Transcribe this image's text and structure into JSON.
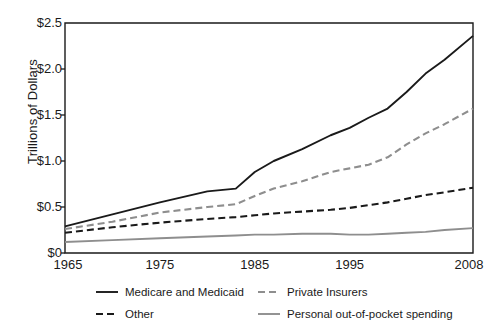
{
  "chart_data": {
    "type": "line",
    "title": "",
    "xlabel": "",
    "ylabel": "Trillions of Dollars",
    "xlim": [
      1965,
      2008
    ],
    "ylim": [
      0,
      2.5
    ],
    "grid": false,
    "legend_position": "bottom",
    "xticks": [
      "1965",
      "1975",
      "1985",
      "1995",
      "2008"
    ],
    "xtick_values": [
      1965,
      1975,
      1985,
      1995,
      2008
    ],
    "yticks": [
      "$0",
      "$0.5",
      "$1.0",
      "$1.5",
      "$2.0",
      "$2.5"
    ],
    "ytick_values": [
      0,
      0.5,
      1.0,
      1.5,
      2.0,
      2.5
    ],
    "x": [
      1965,
      1970,
      1975,
      1980,
      1983,
      1985,
      1987,
      1990,
      1993,
      1995,
      1997,
      1999,
      2001,
      2003,
      2005,
      2008
    ],
    "series": [
      {
        "name": "Medicare and Medicaid",
        "style": "solid",
        "color": "#1a1a1a",
        "values": [
          0.29,
          0.42,
          0.55,
          0.67,
          0.7,
          0.88,
          1.0,
          1.13,
          1.28,
          1.36,
          1.47,
          1.57,
          1.75,
          1.95,
          2.1,
          2.36
        ]
      },
      {
        "name": "Private Insurers",
        "style": "dashed",
        "color": "#8e8e8e",
        "values": [
          0.26,
          0.34,
          0.44,
          0.5,
          0.53,
          0.62,
          0.7,
          0.78,
          0.88,
          0.92,
          0.96,
          1.04,
          1.18,
          1.3,
          1.4,
          1.57
        ]
      },
      {
        "name": "Other",
        "style": "dashed",
        "color": "#1a1a1a",
        "values": [
          0.22,
          0.28,
          0.33,
          0.37,
          0.39,
          0.41,
          0.43,
          0.45,
          0.47,
          0.49,
          0.52,
          0.55,
          0.59,
          0.63,
          0.66,
          0.71
        ]
      },
      {
        "name": "Personal out-of-pocket spending",
        "style": "solid",
        "color": "#8e8e8e",
        "values": [
          0.12,
          0.14,
          0.16,
          0.18,
          0.19,
          0.2,
          0.2,
          0.21,
          0.21,
          0.2,
          0.2,
          0.21,
          0.22,
          0.23,
          0.25,
          0.27
        ]
      }
    ]
  },
  "axis": {
    "ylabel": "Trillions of Dollars",
    "ytick_labels": [
      "$2.5",
      "$2.0",
      "$1.5",
      "$1.0",
      "$0.5",
      "$0"
    ],
    "xtick_labels": [
      "1965",
      "1975",
      "1985",
      "1995",
      "2008"
    ]
  },
  "legend": {
    "items": [
      {
        "label": "Medicare and Medicaid",
        "style": "solid",
        "color": "#1a1a1a"
      },
      {
        "label": "Private Insurers",
        "style": "dashed",
        "color": "#8e8e8e"
      },
      {
        "label": "Other",
        "style": "dashed",
        "color": "#1a1a1a"
      },
      {
        "label": "Personal out-of-pocket spending",
        "style": "solid",
        "color": "#8e8e8e"
      }
    ]
  },
  "colors": {
    "axis": "#1a1a1a",
    "black_series": "#1a1a1a",
    "gray_series": "#8e8e8e",
    "background": "#ffffff"
  }
}
